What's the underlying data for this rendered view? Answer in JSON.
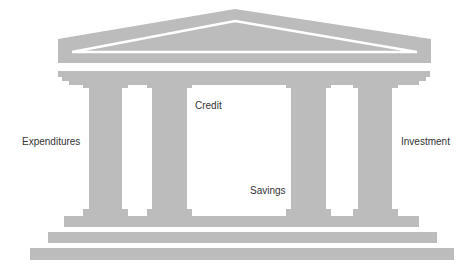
{
  "diagram": {
    "type": "temple",
    "fill_color": "#bcbcbc",
    "text_color": "#333333",
    "background": "#ffffff",
    "labels": [
      {
        "id": "expenditures",
        "text": "Expenditures"
      },
      {
        "id": "credit",
        "text": "Credit"
      },
      {
        "id": "savings",
        "text": "Savings"
      },
      {
        "id": "investment",
        "text": "Investment"
      }
    ],
    "columns": 4,
    "base_steps": 3
  }
}
